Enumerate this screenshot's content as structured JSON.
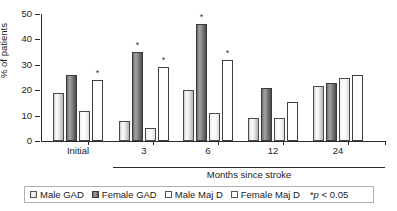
{
  "chart_data": {
    "type": "bar",
    "title": "",
    "xlabel": "Months since stroke",
    "ylabel": "% of patients",
    "ylim": [
      0,
      50
    ],
    "yticks": [
      0,
      10,
      20,
      30,
      40,
      50
    ],
    "grid": false,
    "legend_position": "bottom",
    "categories": [
      "Initial",
      "3",
      "6",
      "12",
      "24"
    ],
    "series": [
      {
        "name": "Male GAD",
        "values": [
          19,
          8,
          20,
          9,
          21.5
        ],
        "significant": [
          false,
          false,
          false,
          false,
          false
        ]
      },
      {
        "name": "Female GAD",
        "values": [
          26,
          35,
          46,
          21,
          23
        ],
        "significant": [
          false,
          true,
          true,
          false,
          false
        ]
      },
      {
        "name": "Male Maj D",
        "values": [
          12,
          5,
          11,
          9,
          25
        ],
        "significant": [
          false,
          false,
          false,
          false,
          false
        ]
      },
      {
        "name": "Female Maj D",
        "values": [
          24,
          29,
          32,
          15.5,
          26
        ],
        "significant": [
          true,
          true,
          true,
          false,
          false
        ]
      }
    ],
    "significance_marker": "*",
    "significance_note": "p < 0.05"
  },
  "axes": {
    "y_label": "% of patients",
    "y_ticks": [
      "0",
      "10",
      "20",
      "30",
      "40",
      "50"
    ],
    "x_label": "Months since stroke",
    "x_group_labels": [
      "Initial",
      "3",
      "6",
      "12",
      "24"
    ]
  },
  "legend": {
    "items": [
      {
        "label": "Male GAD",
        "swatch": "light-gray-gradient"
      },
      {
        "label": "Female GAD",
        "swatch": "dark-gray-gradient"
      },
      {
        "label": "Male Maj D",
        "swatch": "white"
      },
      {
        "label": "Female Maj D",
        "swatch": "white"
      }
    ],
    "pvalue_marker": "*",
    "pvalue_italic": "p",
    "pvalue_rest": " < 0.05"
  },
  "colors": {
    "axis": "#2b2b2b",
    "text": "#1a1a1a",
    "male_gad_fill": "#e8e8e8",
    "female_gad_fill": "#7a7a7a",
    "male_majd_fill": "#f7f7f7",
    "female_majd_fill": "#ffffff",
    "legend_border": "#b0b0b0"
  }
}
